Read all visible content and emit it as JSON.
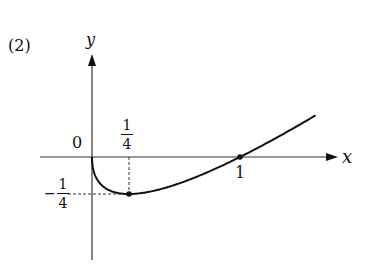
{
  "problem_label": "(2)",
  "chart_data": {
    "type": "line",
    "title": "",
    "function": "y = x - sqrt(x)",
    "xlabel": "x",
    "ylabel": "y",
    "origin_label": "0",
    "x_ticks": [
      {
        "value": 0.25,
        "label": "1/4"
      },
      {
        "value": 1,
        "label": "1"
      }
    ],
    "y_ticks": [
      {
        "value": -0.25,
        "label": "-1/4"
      }
    ],
    "points": [
      {
        "x": 0,
        "y": 0,
        "note": "origin, vertical tangent"
      },
      {
        "x": 0.25,
        "y": -0.25,
        "note": "minimum"
      },
      {
        "x": 1,
        "y": 0,
        "note": "x-intercept"
      }
    ],
    "x_range": [
      0,
      1.5
    ],
    "y_range": [
      -0.25,
      0.28
    ],
    "grid": false,
    "legend": false
  },
  "labels": {
    "x_axis": "x",
    "y_axis": "y",
    "origin": "0",
    "quarter_num": "1",
    "quarter_den": "4",
    "neg_sign": "−",
    "one": "1"
  }
}
